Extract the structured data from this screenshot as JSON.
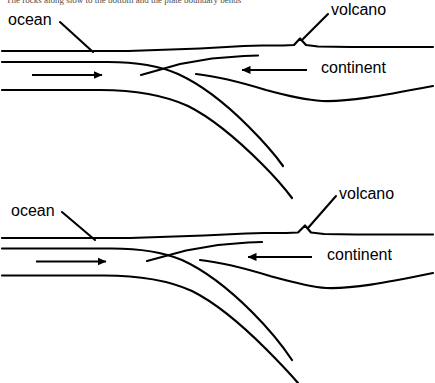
{
  "figure": {
    "type": "cross-section-diagram",
    "panel_count": 2,
    "background_color": "#ffffff",
    "line_color": "#000000",
    "truncated_caption_top": "The rocks along slow to the bottom and the plate boundary bends"
  },
  "panels": [
    {
      "id": "top-panel",
      "labels": {
        "ocean": "ocean",
        "volcano": "volcano",
        "continent": "continent"
      },
      "arrows": {
        "oceanic_plate_motion": "right",
        "continental_plate_motion": "left"
      }
    },
    {
      "id": "bottom-panel",
      "labels": {
        "ocean": "ocean",
        "volcano": "volcano",
        "continent": "continent"
      },
      "arrows": {
        "oceanic_plate_motion": "right",
        "continental_plate_motion": "left"
      }
    }
  ]
}
